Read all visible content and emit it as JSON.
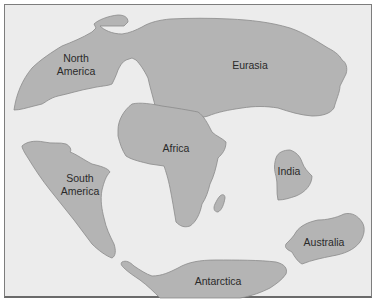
{
  "figure": {
    "background_color": "#ececec",
    "land_color": "#b4b4b4",
    "outline_color": "#8a8a8a",
    "continents": [
      {
        "id": "north-america",
        "label_line1": "North",
        "label_line2": "America"
      },
      {
        "id": "eurasia",
        "label_line1": "Eurasia"
      },
      {
        "id": "africa",
        "label_line1": "Africa"
      },
      {
        "id": "south-america",
        "label_line1": "South",
        "label_line2": "America"
      },
      {
        "id": "india",
        "label_line1": "India"
      },
      {
        "id": "australia",
        "label_line1": "Australia"
      },
      {
        "id": "antarctica",
        "label_line1": "Antarctica"
      },
      {
        "id": "madagascar",
        "label_line1": ""
      }
    ]
  }
}
